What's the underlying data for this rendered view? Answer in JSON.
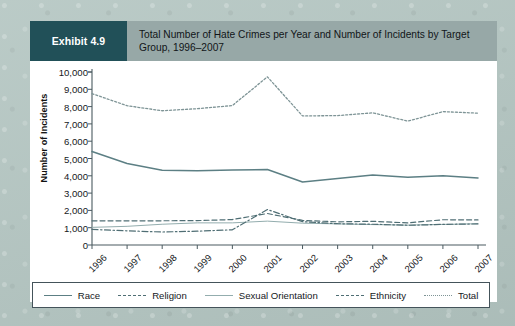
{
  "exhibit": {
    "badge_label": "Exhibit 4.9",
    "title": "Total Number of Hate Crimes per Year and Number of Incidents by Target Group, 1996–2007"
  },
  "colors": {
    "page_background": "#b3c5c1",
    "header_band": "#97a8a7",
    "badge_background": "#215058",
    "badge_text": "#ffffff",
    "panel_background": "#ffffff",
    "axis": "#4a5a60",
    "series_race": "#5c7f84",
    "series_religion": "#4f6e74",
    "series_sexual_orientation": "#93adae",
    "series_ethnicity": "#4f6e74",
    "series_total": "#7e9496"
  },
  "chart_data": {
    "type": "line",
    "title": "Total Number of Hate Crimes per Year and Number of Incidents by Target Group, 1996–2007",
    "xlabel": "",
    "ylabel": "Number of Incidents",
    "categories": [
      "1996",
      "1997",
      "1998",
      "1999",
      "2000",
      "2001",
      "2002",
      "2003",
      "2004",
      "2005",
      "2006",
      "2007"
    ],
    "ylim": [
      0,
      10000
    ],
    "ytick_labels": [
      "10,000",
      "9,000",
      "8,000",
      "7,000",
      "6,000",
      "5,000",
      "4,000",
      "3,000",
      "2,000",
      "1,000",
      "0"
    ],
    "ytick_values": [
      10000,
      9000,
      8000,
      7000,
      6000,
      5000,
      4000,
      3000,
      2000,
      1000,
      0
    ],
    "grid": false,
    "legend_position": "bottom",
    "series": [
      {
        "name": "Race",
        "style": "solid",
        "color": "#5c7f84",
        "values": [
          5400,
          4710,
          4320,
          4290,
          4330,
          4360,
          3640,
          3840,
          4040,
          3920,
          4000,
          3870
        ]
      },
      {
        "name": "Religion",
        "style": "dashed",
        "color": "#4f6e74",
        "values": [
          1400,
          1400,
          1400,
          1410,
          1470,
          1820,
          1420,
          1340,
          1370,
          1280,
          1460,
          1450
        ]
      },
      {
        "name": "Sexual Orientation",
        "style": "solid-thin",
        "color": "#93adae",
        "values": [
          1020,
          1080,
          1200,
          1280,
          1280,
          1380,
          1260,
          1220,
          1180,
          1150,
          1190,
          1230
        ]
      },
      {
        "name": "Ethnicity",
        "style": "dash-dot",
        "color": "#4f6e74",
        "values": [
          900,
          820,
          750,
          800,
          880,
          2050,
          1350,
          1230,
          1200,
          1140,
          1190,
          1220
        ]
      },
      {
        "name": "Total",
        "style": "dotted",
        "color": "#7e9496",
        "values": [
          8750,
          8050,
          7760,
          7880,
          8060,
          9720,
          7460,
          7480,
          7640,
          7160,
          7710,
          7620
        ]
      }
    ]
  }
}
